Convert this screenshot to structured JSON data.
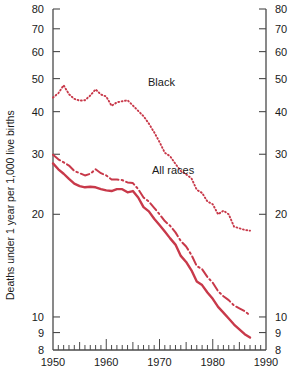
{
  "chart_data": {
    "type": "line",
    "title": "",
    "xlabel": "",
    "ylabel": "Deaths under 1 year per 1,000 live births",
    "yscale": "log",
    "ylim": [
      8,
      80
    ],
    "xlim": [
      1950,
      1990
    ],
    "grid": false,
    "legend": "inline-annotations",
    "y_ticks": [
      8,
      9,
      10,
      20,
      30,
      40,
      50,
      60,
      70,
      80
    ],
    "y_tick_labels": [
      "8",
      "9",
      "10",
      "20",
      "30",
      "40",
      "50",
      "60",
      "70",
      "80"
    ],
    "x_ticks": [
      1950,
      1960,
      1970,
      1980,
      1990
    ],
    "x_tick_labels": [
      "1950",
      "1960",
      "1970",
      "1980",
      "1990"
    ],
    "x_minor_tick_interval": 1,
    "x_mid_tick_interval": 5,
    "axis_labels_on_right": true,
    "line_color": "#C8394A",
    "x": [
      1950,
      1951,
      1952,
      1953,
      1954,
      1955,
      1956,
      1957,
      1958,
      1959,
      1960,
      1961,
      1962,
      1963,
      1964,
      1965,
      1966,
      1967,
      1968,
      1969,
      1970,
      1971,
      1972,
      1973,
      1974,
      1975,
      1976,
      1977,
      1978,
      1979,
      1980,
      1981,
      1982,
      1983,
      1984,
      1985,
      1986,
      1987
    ],
    "series": [
      {
        "name": "Black",
        "style": "dotted",
        "label_text": "Black",
        "values": [
          44.0,
          45.3,
          47.8,
          45.0,
          43.6,
          43.1,
          43.2,
          44.6,
          46.5,
          44.9,
          44.3,
          41.6,
          42.6,
          42.9,
          43.2,
          41.7,
          40.2,
          38.8,
          36.9,
          34.8,
          32.6,
          30.3,
          29.6,
          28.1,
          26.8,
          26.2,
          25.5,
          23.6,
          23.1,
          21.8,
          21.4,
          20.0,
          20.5,
          20.0,
          18.4,
          18.2,
          18.0,
          17.9
        ]
      },
      {
        "name": "All races",
        "style": "dash-dot",
        "label_text": "All races",
        "values": [
          29.9,
          29.0,
          28.4,
          27.8,
          26.8,
          26.4,
          26.0,
          26.3,
          27.1,
          26.4,
          26.0,
          25.3,
          25.3,
          25.2,
          24.8,
          24.7,
          23.7,
          22.4,
          21.8,
          20.9,
          20.0,
          19.1,
          18.5,
          17.7,
          16.7,
          16.1,
          15.2,
          14.1,
          13.8,
          13.1,
          12.6,
          11.9,
          11.5,
          11.2,
          10.8,
          10.6,
          10.4,
          10.1
        ]
      },
      {
        "name": "White",
        "style": "solid",
        "label_text": "",
        "values": [
          28.2,
          27.1,
          26.3,
          25.4,
          24.6,
          24.2,
          24.0,
          24.1,
          24.0,
          23.7,
          23.5,
          23.4,
          23.7,
          23.7,
          23.2,
          23.4,
          22.4,
          21.0,
          20.4,
          19.4,
          18.6,
          17.8,
          17.0,
          16.3,
          15.1,
          14.5,
          13.7,
          12.7,
          12.4,
          11.8,
          11.3,
          10.7,
          10.3,
          9.9,
          9.5,
          9.2,
          8.9,
          8.7
        ]
      }
    ],
    "annotations": [
      {
        "text": "Black",
        "x_px": 148,
        "y_px": 86
      },
      {
        "text": "All races",
        "x_px": 152,
        "y_px": 174
      }
    ]
  }
}
